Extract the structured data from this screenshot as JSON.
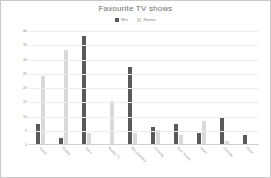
{
  "chart_data": {
    "type": "bar",
    "title": "Favourite TV shows",
    "xlabel": "",
    "ylabel": "",
    "ylim": [
      0,
      40
    ],
    "ytick_step": 5,
    "yticks": [
      "0",
      "5",
      "10",
      "15",
      "20",
      "25",
      "30",
      "35",
      "40"
    ],
    "grid": true,
    "legend_position": "top-center",
    "categories": [
      "Soaps",
      "Drama",
      "Sport",
      "Reality TV",
      "Documentary",
      "Cooking",
      "Quiz Shows",
      "News",
      "Comedy",
      "Other"
    ],
    "series": [
      {
        "name": "Men",
        "color": "#595959",
        "values": [
          7,
          2,
          38,
          0,
          27,
          6,
          7,
          4,
          9,
          3
        ]
      },
      {
        "name": "Women",
        "color": "#d9d9d9",
        "values": [
          24,
          33,
          4,
          15,
          4,
          5,
          3,
          8,
          1,
          0
        ]
      }
    ]
  },
  "style": {
    "background": "#ffffff",
    "border_color": "#c8c8c8",
    "title_color": "#6e6e6e",
    "tick_color": "#8a8a8a",
    "grid_color": "#eeeeee",
    "axis_color": "#d0d0d0"
  }
}
